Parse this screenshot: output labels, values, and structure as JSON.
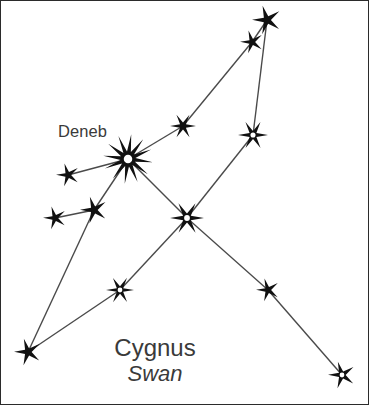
{
  "figure": {
    "kind": "constellation-diagram",
    "background_color": "#ffffff",
    "border_color": "#2b2b2b",
    "line_color": "#4a4a4a",
    "star_fill": "#111111",
    "star_hole": "#ffffff",
    "text_color": "#3a3a3a"
  },
  "labels": {
    "deneb": "Deneb",
    "title_primary": "Cygnus",
    "title_secondary": "Swan"
  },
  "chart_data": {
    "type": "scatter",
    "title": "Cygnus",
    "subtitle": "Swan",
    "xlabel": "",
    "ylabel": "",
    "xlim": [
      0,
      370
    ],
    "ylim": [
      0,
      406
    ],
    "grid": false,
    "legend": null,
    "annotations": [
      {
        "text": "Deneb",
        "x": 58,
        "y": 135,
        "anchor": "left"
      },
      {
        "text": "Cygnus",
        "x": 155,
        "y": 348,
        "anchor": "center"
      },
      {
        "text": "Swan",
        "x": 155,
        "y": 373,
        "anchor": "center"
      }
    ],
    "points": [
      {
        "id": "s1",
        "name": "top-apex-star",
        "x": 267,
        "y": 20,
        "size": 15,
        "points": 5,
        "hollow": false
      },
      {
        "id": "s2",
        "name": "upper-wing-star",
        "x": 252,
        "y": 42,
        "size": 12,
        "points": 5,
        "hollow": false
      },
      {
        "id": "s3",
        "name": "mid-wing-star",
        "x": 183,
        "y": 126,
        "size": 13,
        "points": 6,
        "hollow": false
      },
      {
        "id": "s4",
        "name": "right-wing-hollow-star",
        "x": 253,
        "y": 135,
        "size": 15,
        "points": 6,
        "hollow": true
      },
      {
        "id": "s5",
        "name": "deneb-star",
        "x": 128,
        "y": 159,
        "size": 25,
        "points": 12,
        "hollow": true
      },
      {
        "id": "s6",
        "name": "left-outer-star",
        "x": 68,
        "y": 175,
        "size": 12,
        "points": 5,
        "hollow": false
      },
      {
        "id": "s7",
        "name": "left-lower-star",
        "x": 94,
        "y": 210,
        "size": 14,
        "points": 5,
        "hollow": false
      },
      {
        "id": "s8",
        "name": "far-left-star",
        "x": 55,
        "y": 218,
        "size": 12,
        "points": 5,
        "hollow": false
      },
      {
        "id": "s9",
        "name": "sadr-center-star",
        "x": 187,
        "y": 218,
        "size": 17,
        "points": 6,
        "hollow": true
      },
      {
        "id": "s10",
        "name": "lower-mid-hollow-star",
        "x": 120,
        "y": 290,
        "size": 14,
        "points": 6,
        "hollow": true
      },
      {
        "id": "s11",
        "name": "lower-right-star",
        "x": 268,
        "y": 290,
        "size": 12,
        "points": 5,
        "hollow": false
      },
      {
        "id": "s12",
        "name": "bottom-left-star",
        "x": 28,
        "y": 352,
        "size": 14,
        "points": 5,
        "hollow": false
      },
      {
        "id": "s13",
        "name": "albireo-bottom-star",
        "x": 342,
        "y": 375,
        "size": 14,
        "points": 5,
        "hollow": true
      }
    ],
    "edges": [
      {
        "from": "s1",
        "to": "s4"
      },
      {
        "from": "s1",
        "to": "s2"
      },
      {
        "from": "s2",
        "to": "s3"
      },
      {
        "from": "s3",
        "to": "s5"
      },
      {
        "from": "s4",
        "to": "s9"
      },
      {
        "from": "s5",
        "to": "s6"
      },
      {
        "from": "s5",
        "to": "s7"
      },
      {
        "from": "s5",
        "to": "s9"
      },
      {
        "from": "s7",
        "to": "s8"
      },
      {
        "from": "s7",
        "to": "s12"
      },
      {
        "from": "s9",
        "to": "s10"
      },
      {
        "from": "s10",
        "to": "s12"
      },
      {
        "from": "s9",
        "to": "s11"
      },
      {
        "from": "s11",
        "to": "s13"
      }
    ]
  }
}
